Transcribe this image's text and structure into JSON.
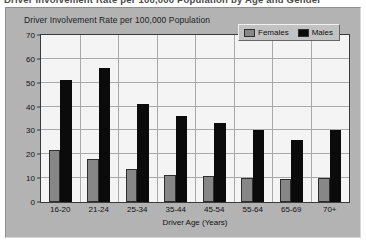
{
  "caption": {
    "text": "Driver Involvement Rate per 100,000 Population by Age and Gender"
  },
  "chart_data": {
    "type": "bar",
    "title": "Driver Involvement Rate per 100,000 Population",
    "xlabel": "Driver Age (Years)",
    "ylabel": "",
    "categories": [
      "16-20",
      "21-24",
      "25-34",
      "35-44",
      "45-54",
      "55-64",
      "65-69",
      "70+"
    ],
    "series": [
      {
        "name": "Females",
        "color": "#878787",
        "values": [
          22,
          18,
          14,
          11.5,
          11,
          10,
          9.5,
          10
        ]
      },
      {
        "name": "Males",
        "color": "#0b0b0b",
        "values": [
          51,
          56,
          41,
          36,
          33,
          30,
          26,
          30
        ]
      }
    ],
    "ylim": [
      0,
      70
    ],
    "yticks": [
      0,
      10,
      20,
      30,
      40,
      50,
      60,
      70
    ],
    "grid": true,
    "legend_position": "top-right",
    "legend": [
      "Females",
      "Males"
    ]
  },
  "colors": {
    "panel": "#b3b3b3",
    "plot_background": "#f4f4f4",
    "axis": "#3a3a3a",
    "gridline": "#a9a9a9",
    "females": "#878787",
    "males": "#0b0b0b"
  }
}
